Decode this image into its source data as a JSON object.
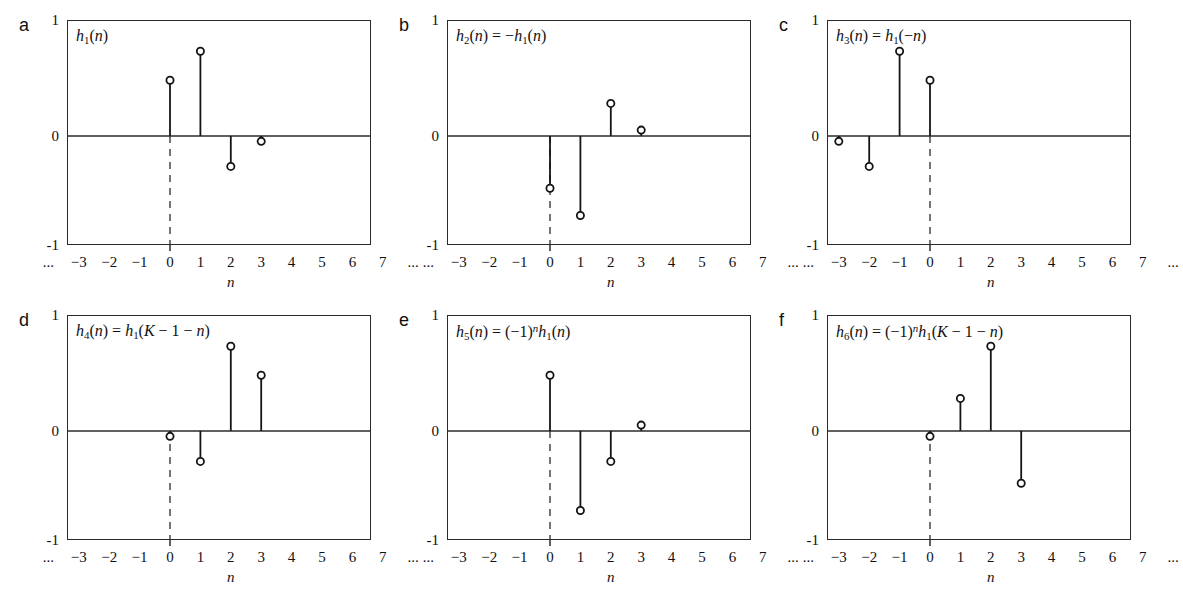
{
  "figure": {
    "background": "#ffffff",
    "ink": "#1a1a1a",
    "axis_color": "#2b2b2b",
    "marker": "open-circle"
  },
  "axes": {
    "y_ticks": [
      "1",
      "0",
      "-1"
    ],
    "y_tick_values": [
      1,
      0,
      -1
    ],
    "ylim": [
      -1,
      1
    ],
    "x_ticks": [
      "...",
      "−3",
      "−2",
      "−1",
      "0",
      "1",
      "2",
      "3",
      "4",
      "5",
      "6",
      "7",
      "..."
    ],
    "x_tick_values": [
      -4,
      -3,
      -2,
      -1,
      0,
      1,
      2,
      3,
      4,
      5,
      6,
      7,
      8
    ],
    "xlim": [
      -4.4,
      8.4
    ],
    "xlabel": "n",
    "zero_line": true,
    "origin_dashed_marker": true,
    "grid": false,
    "legend": "none"
  },
  "panels": [
    {
      "letter": "a",
      "title_html": "<i>h</i><sub>1</sub>(<i>n</i>)",
      "title_text": "h1(n)",
      "stems": [
        {
          "n": 0,
          "value": 0.48
        },
        {
          "n": 1,
          "value": 0.73
        },
        {
          "n": 2,
          "value": -0.28
        },
        {
          "n": 3,
          "value": -0.05
        }
      ]
    },
    {
      "letter": "b",
      "title_html": "<i>h</i><sub>2</sub>(<i>n</i>) = −<i>h</i><sub>1</sub>(<i>n</i>)",
      "title_text": "h2(n) = -h1(n)",
      "stems": [
        {
          "n": 0,
          "value": -0.48
        },
        {
          "n": 1,
          "value": -0.73
        },
        {
          "n": 2,
          "value": 0.28
        },
        {
          "n": 3,
          "value": 0.05
        }
      ]
    },
    {
      "letter": "c",
      "title_html": "<i>h</i><sub>3</sub>(<i>n</i>) = <i>h</i><sub>1</sub>(−<i>n</i>)",
      "title_text": "h3(n) = h1(-n)",
      "stems": [
        {
          "n": -3,
          "value": -0.05
        },
        {
          "n": -2,
          "value": -0.28
        },
        {
          "n": -1,
          "value": 0.73
        },
        {
          "n": 0,
          "value": 0.48
        }
      ]
    },
    {
      "letter": "d",
      "title_html": "<i>h</i><sub>4</sub>(<i>n</i>) = <i>h</i><sub>1</sub>(<i>K</i> − 1 − <i>n</i>)",
      "title_text": "h4(n) = h1(K - 1 - n)",
      "stems": [
        {
          "n": 0,
          "value": -0.05
        },
        {
          "n": 1,
          "value": -0.28
        },
        {
          "n": 2,
          "value": 0.73
        },
        {
          "n": 3,
          "value": 0.48
        }
      ]
    },
    {
      "letter": "e",
      "title_html": "<i>h</i><sub>5</sub>(<i>n</i>) = (−1)<sup>n</sup><i>h</i><sub>1</sub>(<i>n</i>)",
      "title_text": "h5(n) = (-1)^n h1(n)",
      "stems": [
        {
          "n": 0,
          "value": 0.48
        },
        {
          "n": 1,
          "value": -0.73
        },
        {
          "n": 2,
          "value": -0.28
        },
        {
          "n": 3,
          "value": 0.05
        }
      ]
    },
    {
      "letter": "f",
      "title_html": "<i>h</i><sub>6</sub>(<i>n</i>) = (−1)<sup>n</sup><i>h</i><sub>1</sub>(<i>K</i> − 1 − <i>n</i>)",
      "title_text": "h6(n) = (-1)^n h1(K - 1 - n)",
      "stems": [
        {
          "n": 0,
          "value": -0.05
        },
        {
          "n": 1,
          "value": 0.28
        },
        {
          "n": 2,
          "value": 0.73
        },
        {
          "n": 3,
          "value": -0.48
        }
      ]
    }
  ],
  "chart_data": {
    "type": "line",
    "xlabel": "n",
    "ylabel": "",
    "xlim": [
      -4.4,
      8.4
    ],
    "ylim": [
      -1,
      1
    ],
    "grid": false,
    "legend": "none",
    "x": [
      -3,
      -2,
      -1,
      0,
      1,
      2,
      3
    ],
    "series": [
      {
        "name": "h1(n)",
        "panel": "a",
        "values": [
          0,
          0,
          0,
          0.48,
          0.73,
          -0.28,
          -0.05
        ]
      },
      {
        "name": "h2(n) = -h1(n)",
        "panel": "b",
        "values": [
          0,
          0,
          0,
          -0.48,
          -0.73,
          0.28,
          0.05
        ]
      },
      {
        "name": "h3(n) = h1(-n)",
        "panel": "c",
        "values": [
          -0.05,
          -0.28,
          0.73,
          0.48,
          0,
          0,
          0
        ]
      },
      {
        "name": "h4(n) = h1(K-1-n)",
        "panel": "d",
        "values": [
          0,
          0,
          0,
          -0.05,
          -0.28,
          0.73,
          0.48
        ]
      },
      {
        "name": "h5(n) = (-1)^n h1(n)",
        "panel": "e",
        "values": [
          0,
          0,
          0,
          0.48,
          -0.73,
          -0.28,
          0.05
        ]
      },
      {
        "name": "h6(n) = (-1)^n h1(K-1-n)",
        "panel": "f",
        "values": [
          0,
          0,
          0,
          -0.05,
          0.28,
          0.73,
          -0.48
        ]
      }
    ]
  }
}
